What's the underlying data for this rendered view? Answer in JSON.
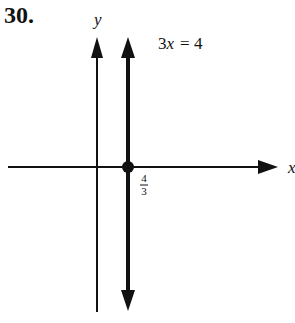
{
  "problem": {
    "number": "30."
  },
  "axes": {
    "x_label": "x",
    "y_label": "y"
  },
  "equation": {
    "label": "3x = 4",
    "lhs": "3",
    "var": "x",
    "rhs": "= 4"
  },
  "intercept": {
    "numerator": "4",
    "denominator": "3",
    "value": 1.3333
  },
  "colors": {
    "ink": "#111111",
    "background": "#ffffff"
  }
}
